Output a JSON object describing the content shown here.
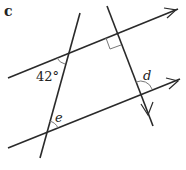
{
  "figure": {
    "part_label": "c",
    "angle_given": "42°",
    "angle_d": "d",
    "angle_e": "e",
    "right_angle_marker": true,
    "colors": {
      "line": "#2a2a2a",
      "arc": "#777777"
    }
  }
}
